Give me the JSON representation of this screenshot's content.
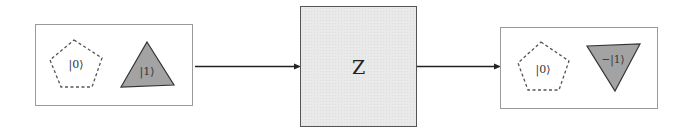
{
  "diagram": {
    "type": "quantum-gate-flow",
    "input_state": {
      "basis0": {
        "label": "|0⟩",
        "shape": "pentagon",
        "style": "dashed-outline"
      },
      "basis1": {
        "label": "|1⟩",
        "shape": "triangle-up",
        "style": "filled-gray"
      }
    },
    "gate": {
      "label": "Z",
      "fill": "#e9e9e9"
    },
    "output_state": {
      "basis0": {
        "label": "|0⟩",
        "shape": "pentagon",
        "style": "dashed-outline"
      },
      "basis1": {
        "label": "−|1⟩",
        "shape": "triangle-down",
        "style": "filled-gray"
      }
    },
    "edges": [
      {
        "from": "input_state",
        "to": "gate"
      },
      {
        "from": "gate",
        "to": "output_state"
      }
    ],
    "colors": {
      "shape_fill": "#a3a3a3",
      "outline": "#444444",
      "box_border": "#9a9a9a"
    }
  }
}
